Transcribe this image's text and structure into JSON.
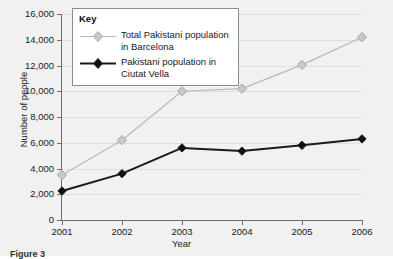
{
  "chart_data": {
    "type": "line",
    "title": "",
    "xlabel": "Year",
    "ylabel": "Number of people",
    "categories": [
      "2001",
      "2002",
      "2003",
      "2004",
      "2005",
      "2006"
    ],
    "xlim": [
      2001,
      2006
    ],
    "ylim": [
      0,
      16000
    ],
    "ytick_step": 2000,
    "yticks": [
      "0",
      "2,000",
      "4,000",
      "6,000",
      "8,000",
      "10,000",
      "12,000",
      "14,000",
      "16,000"
    ],
    "ytick_values": [
      0,
      2000,
      4000,
      6000,
      8000,
      10000,
      12000,
      14000,
      16000
    ],
    "grid": true,
    "grid_axis": "y",
    "legend_title": "Key",
    "legend_position": "top-left-inside",
    "series": [
      {
        "name": "Total Pakistani population in Barcelona",
        "values": [
          3500,
          6200,
          10000,
          10200,
          12050,
          14200
        ],
        "color": "#b9b9b9",
        "marker": "diamond",
        "marker_fill": "#c9c9c9",
        "line_width": 1.2
      },
      {
        "name": "Pakistani population in Ciutat Vella",
        "values": [
          2250,
          3600,
          5600,
          5350,
          5800,
          6300
        ],
        "color": "#1a1a1a",
        "marker": "diamond",
        "marker_fill": "#111111",
        "line_width": 2.0
      }
    ]
  },
  "legend": {
    "title": "Key",
    "entries": [
      {
        "line1": "Total Pakistani population",
        "line2": "in Barcelona"
      },
      {
        "line1": "Pakistani population in",
        "line2": "Ciutat Vella"
      }
    ]
  },
  "caption": {
    "label": "Figure 3",
    "text": ""
  },
  "colors": {
    "background": "#f1f1f1",
    "plot_background": "#f1f1f1",
    "gridline": "#dedede",
    "axis": "#6f6f6f",
    "series_light": "#b9b9b9",
    "series_dark": "#1a1a1a",
    "legend_border": "#8c8c8c",
    "legend_background": "#ffffff",
    "text": "#1a1a1a"
  }
}
